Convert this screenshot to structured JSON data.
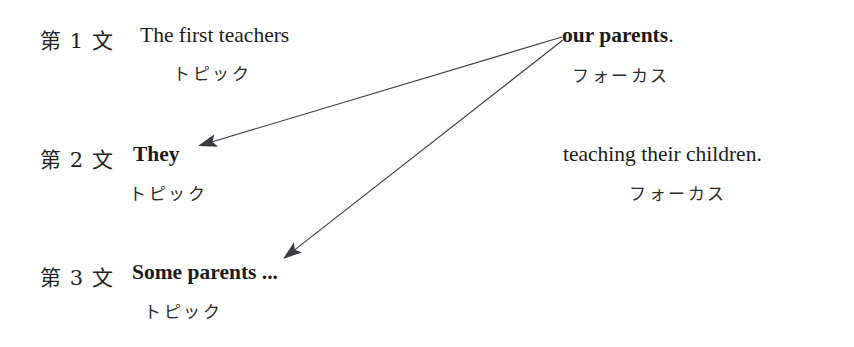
{
  "figure": {
    "background_color": "#ffffff",
    "text_color": "#1a1a1a",
    "arrow_color": "#3a3a44"
  },
  "rows": [
    {
      "marker": "第 1 文",
      "topic_text": "The first teachers",
      "topic_bold": false,
      "topic_label": "トピック",
      "focus_text": "our parents",
      "focus_punct": ".",
      "focus_bold": true,
      "focus_label": "フォーカス"
    },
    {
      "marker": "第 2 文",
      "topic_text": "They",
      "topic_bold": true,
      "topic_label": "トピック",
      "focus_text": "teaching their children.",
      "focus_punct": "",
      "focus_bold": false,
      "focus_label": "フォーカス"
    },
    {
      "marker": "第 3 文",
      "topic_text": "Some parents ...",
      "topic_bold": true,
      "topic_label": "トピック",
      "focus_text": "",
      "focus_punct": "",
      "focus_bold": false,
      "focus_label": ""
    }
  ],
  "arrows": [
    {
      "name": "arrow-our-parents-to-they",
      "from_x": 562,
      "from_y": 37,
      "to_x": 198,
      "to_y": 146,
      "color": "#3a3a44"
    },
    {
      "name": "arrow-our-parents-to-some-parents",
      "from_x": 563,
      "from_y": 40,
      "to_x": 283,
      "to_y": 259,
      "color": "#3a3a44"
    }
  ]
}
